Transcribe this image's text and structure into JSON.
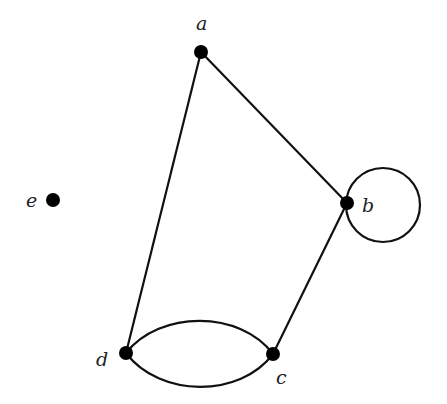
{
  "graph": {
    "vertices": [
      {
        "id": "a",
        "label": "a",
        "x": 201,
        "y": 52,
        "lx": 201,
        "ly": 30
      },
      {
        "id": "b",
        "label": "b",
        "x": 347,
        "y": 203,
        "lx": 370,
        "ly": 209
      },
      {
        "id": "c",
        "label": "c",
        "x": 273,
        "y": 354,
        "lx": 280,
        "ly": 381
      },
      {
        "id": "d",
        "label": "d",
        "x": 126,
        "y": 353,
        "lx": 103,
        "ly": 363
      },
      {
        "id": "e",
        "label": "e",
        "x": 53,
        "y": 200,
        "lx": 31,
        "ly": 207
      }
    ],
    "edges": [
      {
        "from": "a",
        "to": "b",
        "type": "straight"
      },
      {
        "from": "a",
        "to": "d",
        "type": "straight"
      },
      {
        "from": "b",
        "to": "c",
        "type": "straight"
      },
      {
        "from": "d",
        "to": "c",
        "type": "curve-upper"
      },
      {
        "from": "d",
        "to": "c",
        "type": "curve-lower"
      },
      {
        "from": "b",
        "to": "b",
        "type": "loop"
      }
    ],
    "colors": {
      "stroke": "#111111",
      "vertex": "#000000",
      "background": "#ffffff"
    }
  }
}
